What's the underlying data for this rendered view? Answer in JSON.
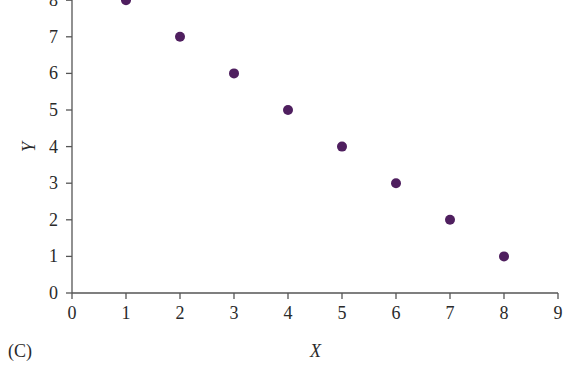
{
  "panel_label": "(C)",
  "chart_data": {
    "type": "scatter",
    "title": "",
    "xlabel": "X",
    "ylabel": "Y",
    "xlim": [
      0,
      9
    ],
    "ylim": [
      0,
      8
    ],
    "x_ticks": [
      0,
      1,
      2,
      3,
      4,
      5,
      6,
      7,
      8,
      9
    ],
    "y_ticks": [
      0,
      1,
      2,
      3,
      4,
      5,
      6,
      7,
      8
    ],
    "grid": false,
    "legend": null,
    "marker_color": "#4f1f5f",
    "series": [
      {
        "name": "data",
        "x": [
          1,
          2,
          3,
          4,
          5,
          6,
          7,
          8
        ],
        "y": [
          8,
          7,
          6,
          5,
          4,
          3,
          2,
          1
        ]
      }
    ]
  }
}
